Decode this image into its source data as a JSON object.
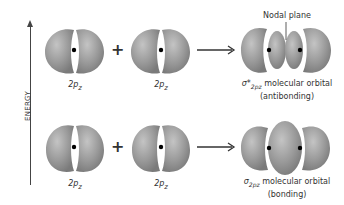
{
  "axis": {
    "label": "ENERGY"
  },
  "top_row": {
    "left_orbital_label": "2p",
    "left_orbital_sub": "z",
    "operator": "+",
    "right_orbital_label": "2p",
    "right_orbital_sub": "z",
    "result": {
      "annotation": "Nodal plane",
      "symbol": "σ*",
      "symbol_sub": "2pz",
      "name": "molecular orbital",
      "type": "(antibonding)"
    }
  },
  "bottom_row": {
    "left_orbital_label": "2p",
    "left_orbital_sub": "z",
    "operator": "+",
    "right_orbital_label": "2p",
    "right_orbital_sub": "z",
    "result": {
      "symbol": "σ",
      "symbol_sub": "2pz",
      "name": "molecular orbital",
      "type": "(bonding)"
    }
  },
  "colors": {
    "lobe": "#8c8c8c",
    "lobe_light": "#b8b8b8",
    "arrow": "#333333",
    "nucleus": "#000000"
  }
}
